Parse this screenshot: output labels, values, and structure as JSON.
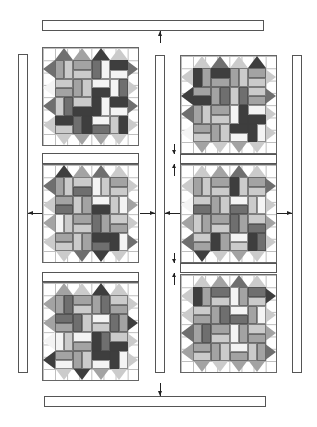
{
  "diagram": {
    "shades": {
      "w": "#f4f4f4",
      "l": "#cbcbcb",
      "m": "#a3a3a3",
      "d": "#6f6f6f",
      "k": "#3e3e3e"
    },
    "borders": {
      "top": {
        "label": "top border strip"
      },
      "bottom": {
        "label": "bottom border strip"
      },
      "left": {
        "label": "left border strip"
      },
      "center": {
        "label": "center vertical sashing"
      },
      "right": {
        "label": "right border strip"
      }
    },
    "blocks": [
      {
        "id": "L1",
        "column": "left",
        "row": 1,
        "tris": {
          "top": [
            "d",
            "m",
            "k",
            "l"
          ],
          "bottom": [
            "l",
            "m",
            "m",
            "l"
          ],
          "left": [
            "d",
            "w",
            "d",
            "l"
          ],
          "right": [
            "d",
            "l",
            "d",
            "l"
          ]
        },
        "units": [
          [
            "v",
            "m",
            "l"
          ],
          [
            "h",
            "m",
            "l"
          ],
          [
            "v",
            "d",
            "w"
          ],
          [
            "h",
            "k",
            "w"
          ],
          [
            "h",
            "l",
            "m"
          ],
          [
            "v",
            "m",
            "l"
          ],
          [
            "h",
            "w",
            "k"
          ],
          [
            "v",
            "w",
            "d"
          ],
          [
            "v",
            "l",
            "d"
          ],
          [
            "h",
            "l",
            "k"
          ],
          [
            "v",
            "k",
            "w"
          ],
          [
            "h",
            "k",
            "w"
          ],
          [
            "h",
            "k",
            "l"
          ],
          [
            "v",
            "d",
            "k"
          ],
          [
            "h",
            "w",
            "d"
          ],
          [
            "v",
            "l",
            "k"
          ]
        ]
      },
      {
        "id": "L2",
        "column": "left",
        "row": 2,
        "sash_above": true,
        "tris": {
          "top": [
            "k",
            "m",
            "d",
            "l"
          ],
          "bottom": [
            "l",
            "d",
            "k",
            "l"
          ],
          "left": [
            "d",
            "l",
            "m",
            "l"
          ],
          "right": [
            "l",
            "m",
            "l",
            "d"
          ]
        },
        "units": [
          [
            "v",
            "m",
            "l"
          ],
          [
            "h",
            "l",
            "d"
          ],
          [
            "v",
            "w",
            "l"
          ],
          [
            "h",
            "m",
            "l"
          ],
          [
            "h",
            "m",
            "d"
          ],
          [
            "v",
            "l",
            "m"
          ],
          [
            "h",
            "w",
            "k"
          ],
          [
            "v",
            "l",
            "w"
          ],
          [
            "v",
            "w",
            "l"
          ],
          [
            "h",
            "m",
            "l"
          ],
          [
            "v",
            "d",
            "m"
          ],
          [
            "h",
            "l",
            "m"
          ],
          [
            "h",
            "m",
            "l"
          ],
          [
            "v",
            "l",
            "m"
          ],
          [
            "h",
            "k",
            "d"
          ],
          [
            "v",
            "k",
            "w"
          ]
        ]
      },
      {
        "id": "L3",
        "column": "left",
        "row": 3,
        "sash_above": true,
        "tris": {
          "top": [
            "m",
            "l",
            "k",
            "l"
          ],
          "bottom": [
            "l",
            "k",
            "m",
            "l"
          ],
          "left": [
            "m",
            "m",
            "w",
            "k"
          ],
          "right": [
            "l",
            "k",
            "l",
            "l"
          ]
        },
        "units": [
          [
            "v",
            "m",
            "d"
          ],
          [
            "h",
            "m",
            "l"
          ],
          [
            "v",
            "m",
            "d"
          ],
          [
            "h",
            "l",
            "m"
          ],
          [
            "h",
            "d",
            "m"
          ],
          [
            "v",
            "d",
            "l"
          ],
          [
            "h",
            "w",
            "l"
          ],
          [
            "v",
            "d",
            "m"
          ],
          [
            "v",
            "w",
            "l"
          ],
          [
            "h",
            "w",
            "m"
          ],
          [
            "v",
            "k",
            "d"
          ],
          [
            "h",
            "l",
            "k"
          ],
          [
            "h",
            "m",
            "w"
          ],
          [
            "v",
            "m",
            "l"
          ],
          [
            "h",
            "k",
            "w"
          ],
          [
            "v",
            "k",
            "w"
          ]
        ]
      },
      {
        "id": "R1",
        "column": "right",
        "row": 1,
        "tris": {
          "top": [
            "l",
            "d",
            "l",
            "k"
          ],
          "bottom": [
            "m",
            "l",
            "m",
            "l"
          ],
          "left": [
            "l",
            "k",
            "d",
            "w"
          ],
          "right": [
            "l",
            "d",
            "l",
            "l"
          ]
        },
        "units": [
          [
            "v",
            "k",
            "m"
          ],
          [
            "h",
            "k",
            "m"
          ],
          [
            "v",
            "m",
            "l"
          ],
          [
            "h",
            "m",
            "l"
          ],
          [
            "h",
            "m",
            "k"
          ],
          [
            "v",
            "m",
            "d"
          ],
          [
            "v",
            "l",
            "d"
          ],
          [
            "h",
            "l",
            "m"
          ],
          [
            "v",
            "m",
            "l"
          ],
          [
            "h",
            "m",
            "l"
          ],
          [
            "v",
            "w",
            "k"
          ],
          [
            "h",
            "w",
            "k"
          ],
          [
            "h",
            "m",
            "l"
          ],
          [
            "v",
            "m",
            "l"
          ],
          [
            "h",
            "k",
            "w"
          ],
          [
            "v",
            "k",
            "w"
          ]
        ]
      },
      {
        "id": "R2",
        "column": "right",
        "row": 2,
        "sash_above": true,
        "tris": {
          "top": [
            "l",
            "m",
            "d",
            "l"
          ],
          "bottom": [
            "k",
            "l",
            "m",
            "l"
          ],
          "left": [
            "l",
            "w",
            "m",
            "d"
          ],
          "right": [
            "d",
            "l",
            "m",
            "l"
          ]
        },
        "units": [
          [
            "v",
            "m",
            "l"
          ],
          [
            "h",
            "m",
            "l"
          ],
          [
            "v",
            "k",
            "l"
          ],
          [
            "h",
            "m",
            "l"
          ],
          [
            "h",
            "l",
            "d"
          ],
          [
            "v",
            "m",
            "l"
          ],
          [
            "h",
            "w",
            "d"
          ],
          [
            "v",
            "l",
            "w"
          ],
          [
            "v",
            "l",
            "m"
          ],
          [
            "h",
            "m",
            "l"
          ],
          [
            "v",
            "d",
            "m"
          ],
          [
            "h",
            "l",
            "d"
          ],
          [
            "h",
            "l",
            "m"
          ],
          [
            "v",
            "k",
            "m"
          ],
          [
            "h",
            "w",
            "l"
          ],
          [
            "v",
            "k",
            "d"
          ]
        ]
      },
      {
        "id": "R3",
        "column": "right",
        "row": 3,
        "sash_above": true,
        "tris": {
          "top": [
            "l",
            "m",
            "d",
            "l"
          ],
          "bottom": [
            "m",
            "l",
            "m",
            "m"
          ],
          "left": [
            "l",
            "l",
            "d",
            "m"
          ],
          "right": [
            "k",
            "l",
            "m",
            "d"
          ]
        },
        "units": [
          [
            "v",
            "k",
            "m"
          ],
          [
            "h",
            "d",
            "l"
          ],
          [
            "v",
            "w",
            "m"
          ],
          [
            "h",
            "d",
            "l"
          ],
          [
            "h",
            "l",
            "m"
          ],
          [
            "v",
            "m",
            "d"
          ],
          [
            "h",
            "w",
            "d"
          ],
          [
            "v",
            "m",
            "w"
          ],
          [
            "v",
            "m",
            "d"
          ],
          [
            "h",
            "m",
            "l"
          ],
          [
            "v",
            "w",
            "m"
          ],
          [
            "h",
            "l",
            "m"
          ],
          [
            "h",
            "m",
            "l"
          ],
          [
            "v",
            "m",
            "l"
          ],
          [
            "h",
            "w",
            "m"
          ],
          [
            "v",
            "l",
            "m"
          ]
        ]
      }
    ],
    "arrows": [
      {
        "label": "top border attaches to quilt top"
      },
      {
        "label": "bottom border attaches to quilt bottom"
      },
      {
        "label": "left border attaches to left column"
      },
      {
        "label": "center sashing joins both columns"
      },
      {
        "label": "right border attaches to right column"
      }
    ]
  }
}
